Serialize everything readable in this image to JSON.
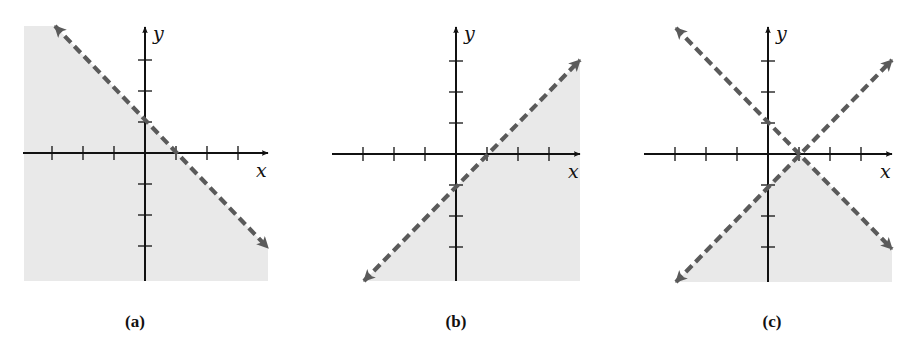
{
  "figure": {
    "panels": [
      {
        "id": "a",
        "label": "(a)"
      },
      {
        "id": "b",
        "label": "(b)"
      },
      {
        "id": "c",
        "label": "(c)"
      }
    ]
  },
  "colors": {
    "shade": "#e9e9e9",
    "boundary": "#5a5a5a",
    "axis": "#111111"
  },
  "chart_data": [
    {
      "type": "line",
      "title": "(a)",
      "xlabel": "x",
      "ylabel": "y",
      "xlim": [
        -4,
        4
      ],
      "ylim": [
        -4,
        4
      ],
      "x_ticks": [
        -3,
        -2,
        -1,
        1,
        2,
        3
      ],
      "y_ticks": [
        -3,
        -2,
        -1,
        1,
        2,
        3
      ],
      "grid": false,
      "series": [
        {
          "name": "boundary",
          "equation": "x + y = 1",
          "style": "dashed",
          "points": [
            [
              -3,
              4
            ],
            [
              4,
              -3
            ]
          ]
        }
      ],
      "shaded_region": "x + y < 1 (below the line)"
    },
    {
      "type": "line",
      "title": "(b)",
      "xlabel": "x",
      "ylabel": "y",
      "xlim": [
        -4,
        4
      ],
      "ylim": [
        -4,
        4
      ],
      "x_ticks": [
        -3,
        -2,
        -1,
        1,
        2,
        3
      ],
      "y_ticks": [
        -3,
        -2,
        -1,
        1,
        2,
        3
      ],
      "grid": false,
      "series": [
        {
          "name": "boundary",
          "equation": "y = x - 1",
          "style": "dashed",
          "points": [
            [
              -3,
              -4
            ],
            [
              4,
              3
            ]
          ]
        }
      ],
      "shaded_region": "y < x - 1 (below/right of the line)"
    },
    {
      "type": "line",
      "title": "(c)",
      "xlabel": "x",
      "ylabel": "y",
      "xlim": [
        -4,
        4
      ],
      "ylim": [
        -4,
        4
      ],
      "x_ticks": [
        -3,
        -2,
        -1,
        1,
        2,
        3
      ],
      "y_ticks": [
        -3,
        -2,
        -1,
        1,
        2,
        3
      ],
      "grid": false,
      "series": [
        {
          "name": "boundary-1",
          "equation": "x + y = 1",
          "style": "dashed",
          "points": [
            [
              -3,
              4
            ],
            [
              4,
              -3
            ]
          ]
        },
        {
          "name": "boundary-2",
          "equation": "y = x - 1",
          "style": "dashed",
          "points": [
            [
              -3,
              -4
            ],
            [
              4,
              3
            ]
          ]
        }
      ],
      "intersection": [
        1,
        0
      ],
      "shaded_region": "x + y < 1 and y < x - 1 (below both lines)"
    }
  ]
}
